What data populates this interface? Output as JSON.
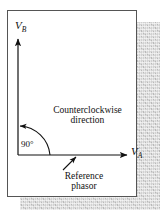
{
  "figure": {
    "axes": {
      "vertical_label": "V",
      "vertical_subscript": "B",
      "horizontal_label": "V",
      "horizontal_subscript": "A"
    },
    "angle": {
      "value": "90",
      "unit": "°",
      "text": "90°"
    },
    "annotations": {
      "rotation_line1": "Counterclockwise",
      "rotation_line2": "direction",
      "reference_line1": "Reference",
      "reference_line2": "phasor"
    },
    "colors": {
      "line": "#111111",
      "panel_border": "#555555",
      "panel_fill": "#ffffff",
      "shadow": "#c9c9c9"
    }
  }
}
